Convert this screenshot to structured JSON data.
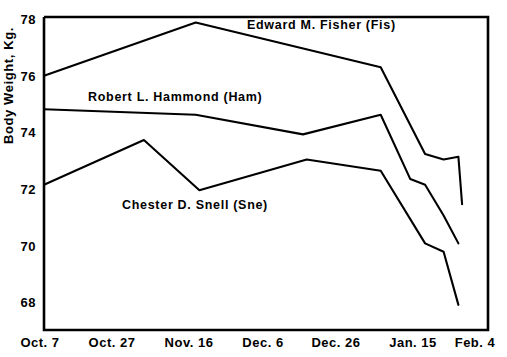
{
  "chart_data": {
    "type": "line",
    "title": "",
    "xlabel": "",
    "ylabel": "Body Weight, Kg.",
    "grid": false,
    "legend_position": "inline-annotations",
    "x_tick_labels": [
      "Oct. 7",
      "Oct. 27",
      "Nov. 16",
      "Dec. 6",
      "Dec. 26",
      "Jan. 15",
      "Feb. 4"
    ],
    "x_tick_values": [
      0,
      20,
      40,
      60,
      80,
      100,
      120
    ],
    "xlim": [
      0,
      120
    ],
    "y_tick_labels": [
      "78",
      "76",
      "74",
      "72",
      "70",
      "68"
    ],
    "y_tick_values": [
      78,
      76,
      74,
      72,
      70,
      68
    ],
    "ylim": [
      66.9,
      78.1
    ],
    "x_unit": "days from Oct. 7",
    "series": [
      {
        "name": "Edward M. Fisher (Fis)",
        "short_name": "Fis",
        "x": [
          0,
          41,
          91,
          103,
          108,
          112,
          113
        ],
        "y": [
          76.0,
          77.9,
          76.3,
          73.2,
          73.0,
          73.1,
          71.4
        ]
      },
      {
        "name": "Robert L. Hammond (Ham)",
        "short_name": "Ham",
        "x": [
          0,
          41,
          70,
          91,
          99,
          103,
          108,
          112
        ],
        "y": [
          74.8,
          74.6,
          73.9,
          74.6,
          72.3,
          72.1,
          71.0,
          70.0
        ]
      },
      {
        "name": "Chester D. Snell (Sne)",
        "short_name": "Sne",
        "x": [
          0,
          27,
          42,
          71,
          91,
          103,
          108,
          112
        ],
        "y": [
          72.1,
          73.7,
          71.9,
          73.0,
          72.6,
          70.0,
          69.7,
          67.8
        ]
      }
    ],
    "annotations": [
      {
        "text": "Edward M. Fisher (Fis)",
        "series": "Fis"
      },
      {
        "text": "Robert L. Hammond (Ham)",
        "series": "Ham"
      },
      {
        "text": "Chester D. Snell (Sne)",
        "series": "Sne"
      }
    ]
  },
  "axis": {
    "y_title": "Body Weight, Kg.",
    "y_ticks": [
      {
        "label": "78"
      },
      {
        "label": "76"
      },
      {
        "label": "74"
      },
      {
        "label": "72"
      },
      {
        "label": "70"
      },
      {
        "label": "68"
      }
    ],
    "x_ticks": [
      {
        "label": "Oct. 7"
      },
      {
        "label": "Oct. 27"
      },
      {
        "label": "Nov. 16"
      },
      {
        "label": "Dec. 6"
      },
      {
        "label": "Dec. 26"
      },
      {
        "label": "Jan. 15"
      },
      {
        "label": "Feb. 4"
      }
    ]
  },
  "labels": {
    "fisher": "Edward M. Fisher (Fis)",
    "hammond": "Robert L. Hammond (Ham)",
    "snell": "Chester D. Snell (Sne)"
  },
  "colors": {
    "line": "#000000",
    "axis": "#000000",
    "background": "#ffffff"
  }
}
